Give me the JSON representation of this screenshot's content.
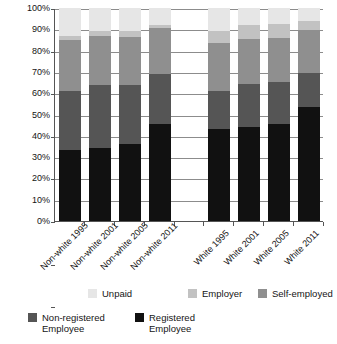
{
  "chart_data": {
    "type": "bar",
    "subtype": "stacked-bar-100",
    "title": "",
    "xlabel": "",
    "ylabel": "",
    "ylim": [
      0,
      100
    ],
    "y_tick_labels": [
      "100%",
      "90%",
      "80%",
      "70%",
      "60%",
      "50%",
      "40%",
      "30%",
      "20%",
      "10%",
      "0%"
    ],
    "y_tick_values": [
      100,
      90,
      80,
      70,
      60,
      50,
      40,
      30,
      20,
      10,
      0
    ],
    "grid": true,
    "legend_position": "bottom",
    "categories": [
      "Non-white 1995",
      "Non-white 2001",
      "Non-white 2005",
      "Non-white 2011",
      "",
      "White 1995",
      "White 2001",
      "White 2005",
      "White 2011"
    ],
    "series": [
      {
        "name": "Registered Employee",
        "color": "#111111",
        "values": [
          33.5,
          34.5,
          36.0,
          45.5,
          null,
          43.0,
          44.0,
          45.5,
          53.5
        ]
      },
      {
        "name": "Non-registered Employee",
        "color": "#555555",
        "values": [
          27.5,
          29.5,
          28.0,
          23.5,
          null,
          18.0,
          20.5,
          20.0,
          16.0
        ]
      },
      {
        "name": "Self-employed",
        "color": "#8f8f8f",
        "values": [
          24.0,
          23.0,
          22.5,
          21.5,
          null,
          22.5,
          21.0,
          20.5,
          20.0
        ]
      },
      {
        "name": "Employer",
        "color": "#c2c2c2",
        "values": [
          2.0,
          2.0,
          2.5,
          1.5,
          null,
          5.5,
          6.5,
          6.5,
          4.5
        ]
      },
      {
        "name": "Unpaid",
        "color": "#e6e6e6",
        "values": [
          13.0,
          11.0,
          11.0,
          8.0,
          null,
          11.0,
          8.0,
          7.5,
          6.0
        ]
      }
    ]
  },
  "legend": {
    "items": [
      {
        "label": "Unpaid",
        "color": "#e6e6e6"
      },
      {
        "label": "Employer",
        "color": "#c2c2c2"
      },
      {
        "label": "Self-employed",
        "color": "#8f8f8f"
      },
      {
        "label": "Non-registered\nEmployee",
        "color": "#555555"
      },
      {
        "label": "Registered\nEmployee",
        "color": "#111111"
      }
    ]
  },
  "axis_color": "#555555",
  "grid_color": "#8c8c8c",
  "background": "#ffffff"
}
